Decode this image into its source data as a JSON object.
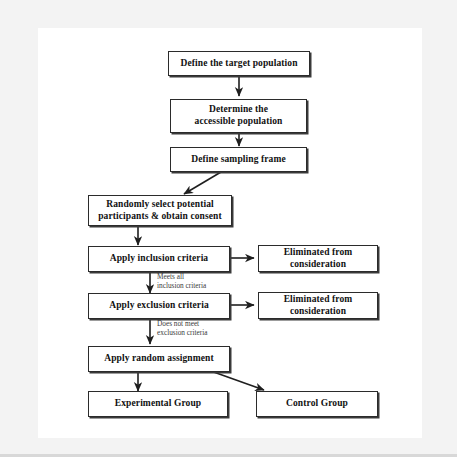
{
  "diagram": {
    "canvas": {
      "background": "#ffffff",
      "frame_color": "#f3f3f3"
    },
    "line_color": "#2b2b2b",
    "nodes": [
      {
        "id": "target_population",
        "label": "Define the target population"
      },
      {
        "id": "accessible_population",
        "label": "Determine the\naccessible population"
      },
      {
        "id": "sampling_frame",
        "label": "Define sampling frame"
      },
      {
        "id": "random_select",
        "label": "Randomly select potential\nparticipants & obtain consent"
      },
      {
        "id": "inclusion_criteria",
        "label": "Apply inclusion criteria"
      },
      {
        "id": "eliminated_1",
        "label": "Eliminated from\nconsideration"
      },
      {
        "id": "exclusion_criteria",
        "label": "Apply exclusion criteria"
      },
      {
        "id": "eliminated_2",
        "label": "Eliminated from\nconsideration"
      },
      {
        "id": "random_assignment",
        "label": "Apply random assignment"
      },
      {
        "id": "experimental_group",
        "label": "Experimental Group"
      },
      {
        "id": "control_group",
        "label": "Control Group"
      }
    ],
    "edge_labels": [
      {
        "id": "meets_inclusion",
        "text": "Meets all\ninclusion criteria"
      },
      {
        "id": "not_meet_exclusion",
        "text": "Does not meet\nexclusion criteria"
      }
    ]
  }
}
